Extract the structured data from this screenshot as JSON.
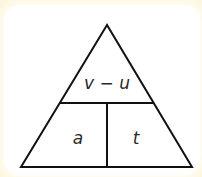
{
  "diagram": {
    "type": "formula-triangle",
    "top_label": "v − u",
    "bottom_left_label": "a",
    "bottom_right_label": "t",
    "line_color": "#111111",
    "background_color": "#ffffff",
    "border_color": "#fdf6dc"
  }
}
